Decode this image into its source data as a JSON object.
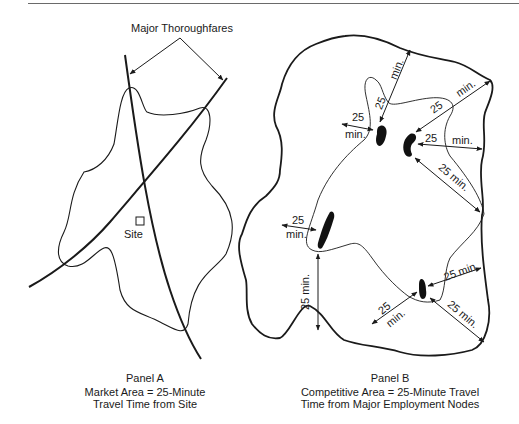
{
  "figure": {
    "top_rule": true,
    "panel_a": {
      "callout_label": "Major Thoroughfares",
      "site_label": "Site",
      "caption_title": "Panel A",
      "caption_line1": "Market Area = 25-Minute",
      "caption_line2": "Travel Time from Site"
    },
    "panel_b": {
      "caption_title": "Panel B",
      "caption_line1": "Competitive Area = 25-Minute Travel",
      "caption_line2": "Time from Major Employment Nodes",
      "travel_labels": {
        "num": "25",
        "unit": "min.",
        "combined": "25 min."
      }
    }
  }
}
